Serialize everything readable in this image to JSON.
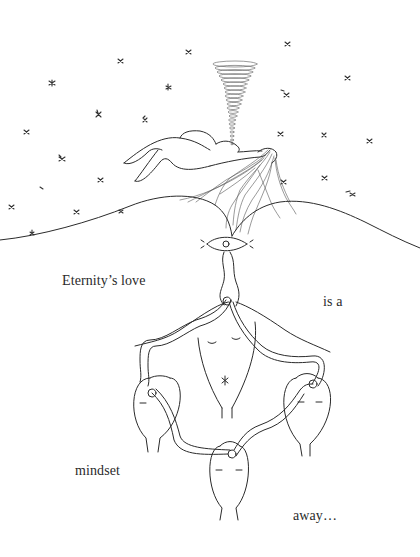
{
  "poem": {
    "lines": [
      {
        "text": "Eternity’s love",
        "x": 62,
        "y": 273
      },
      {
        "text": "is a",
        "x": 323,
        "y": 294
      },
      {
        "text": "mindset",
        "x": 75,
        "y": 463
      },
      {
        "text": "away…",
        "x": 293,
        "y": 508
      }
    ]
  },
  "illustration": {
    "elements": [
      "starry-sky",
      "spiral-vortex",
      "reclining-figure-with-flowing-hair",
      "rolling-hills",
      "eye",
      "connected-figures-with-hands-raised",
      "three-hanging-pods"
    ],
    "ink_color": "#2b2b2b",
    "background_color": "#ffffff"
  }
}
